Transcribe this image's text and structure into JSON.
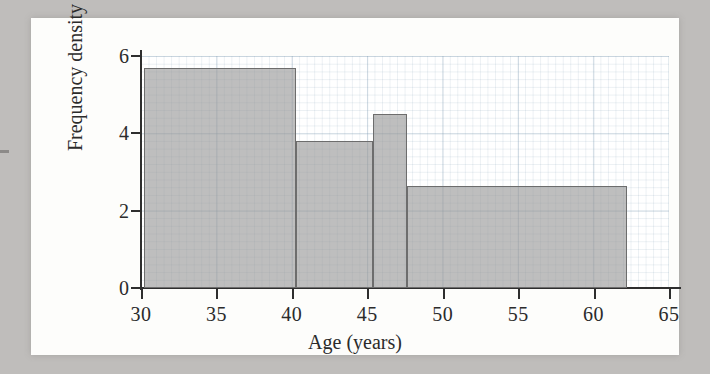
{
  "figure": {
    "background_color": "#bfbdbb",
    "card_color": "#fdfdfb",
    "bar_fill_color": "#969696",
    "bar_edge_color": "#6d6d6d",
    "grid_color": "#7896af",
    "axis_color": "#2e2e2e"
  },
  "chart_data": {
    "type": "bar",
    "title": "",
    "xlabel": "Age (years)",
    "ylabel": "Frequency density",
    "xlim": [
      30,
      65
    ],
    "ylim": [
      0,
      6
    ],
    "grid": true,
    "legend": null,
    "xticks": [
      30,
      35,
      40,
      45,
      50,
      55,
      60,
      65
    ],
    "xticklabels": [
      "30",
      "35",
      "40",
      "45",
      "50",
      "55",
      "60",
      "65"
    ],
    "yticks": [
      0,
      2,
      4,
      6
    ],
    "yticklabels": [
      "0",
      "2",
      "4",
      "6"
    ],
    "bins": [
      {
        "start": 30.2,
        "end": 40.3,
        "density": 5.7
      },
      {
        "start": 40.3,
        "end": 45.4,
        "density": 3.8
      },
      {
        "start": 45.4,
        "end": 47.6,
        "density": 4.5
      },
      {
        "start": 47.6,
        "end": 62.2,
        "density": 2.65
      }
    ],
    "bin_edges": [
      30.2,
      40.3,
      45.4,
      47.6,
      62.2
    ],
    "values": [
      5.7,
      3.8,
      4.5,
      2.65
    ]
  }
}
